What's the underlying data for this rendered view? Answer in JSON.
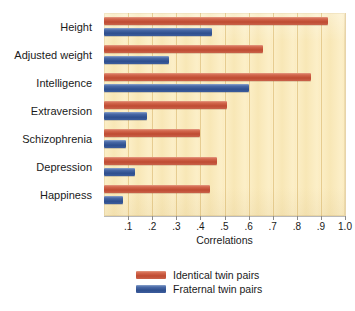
{
  "chart_data": {
    "type": "bar",
    "orientation": "horizontal",
    "title": "",
    "xlabel": "Correlations",
    "ylabel": "",
    "xlim": [
      0,
      1.0
    ],
    "xticks": [
      0.1,
      0.2,
      0.3,
      0.4,
      0.5,
      0.6,
      0.7,
      0.8,
      0.9,
      1.0
    ],
    "xtick_labels": [
      ".1",
      ".2",
      ".3",
      ".4",
      ".5",
      ".6",
      ".7",
      ".8",
      ".9",
      "1.0"
    ],
    "grid": true,
    "grid_axis": "x",
    "legend_position": "bottom",
    "categories": [
      "Height",
      "Adjusted weight",
      "Intelligence",
      "Extraversion",
      "Schizophrenia",
      "Depression",
      "Happiness"
    ],
    "series": [
      {
        "name": "Identical twin pairs",
        "color": "#c1553f",
        "values": [
          0.93,
          0.66,
          0.86,
          0.51,
          0.4,
          0.47,
          0.44
        ]
      },
      {
        "name": "Fraternal twin pairs",
        "color": "#3a5fa0",
        "values": [
          0.45,
          0.27,
          0.6,
          0.18,
          0.09,
          0.13,
          0.08
        ]
      }
    ]
  },
  "colors": {
    "page_background": "#ffffff",
    "panel_background": "#fbedc4",
    "gridline": "#d6b064",
    "axis": "#b9b9b9",
    "text": "#1a1a1a",
    "identical": "#c1553f",
    "fraternal": "#3a5fa0"
  }
}
